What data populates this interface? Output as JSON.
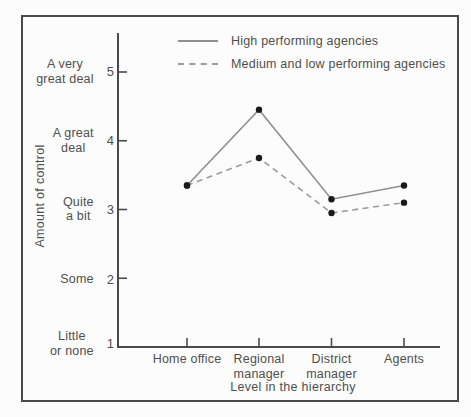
{
  "figure": {
    "background": "#fcfcfc",
    "frame_color": "#4a4a4a",
    "axis_color": "#4a4a4a",
    "marker_color": "#1a1a1a",
    "text_color": "#4f4f4f"
  },
  "axes": {
    "y_ticks": [
      {
        "value": "5",
        "label": "A very\ngreat deal"
      },
      {
        "value": "4",
        "label": "A great\ndeal"
      },
      {
        "value": "3",
        "label": "Quite\na bit"
      },
      {
        "value": "2",
        "label": "Some"
      },
      {
        "value": "1",
        "label": "Little\nor none"
      }
    ],
    "x_tick_labels": [
      "Home office",
      "Regional\nmanager",
      "District\nmanager",
      "Agents"
    ]
  },
  "chart_data": {
    "type": "line",
    "title": "",
    "categories": [
      "Home office",
      "Regional manager",
      "District manager",
      "Agents"
    ],
    "series": [
      {
        "name": "High performing agencies",
        "style": "solid",
        "color": "#8f8f8f",
        "marker": "filled-circle",
        "values": [
          3.35,
          4.45,
          3.15,
          3.35
        ]
      },
      {
        "name": "Medium and low performing agencies",
        "style": "dashed",
        "color": "#9b9b9b",
        "marker": "filled-circle",
        "values": [
          3.35,
          3.75,
          2.95,
          3.1
        ]
      }
    ],
    "xlabel": "Level in the hierarchy",
    "ylabel": "Amount of control",
    "ylim": [
      1,
      5
    ],
    "yticks_numeric": [
      1,
      2,
      3,
      4,
      5
    ],
    "ytick_verbal_anchors": [
      "Little or none",
      "Some",
      "Quite a bit",
      "A great deal",
      "A very great deal"
    ],
    "grid": false,
    "legend_position": "top-inside"
  }
}
